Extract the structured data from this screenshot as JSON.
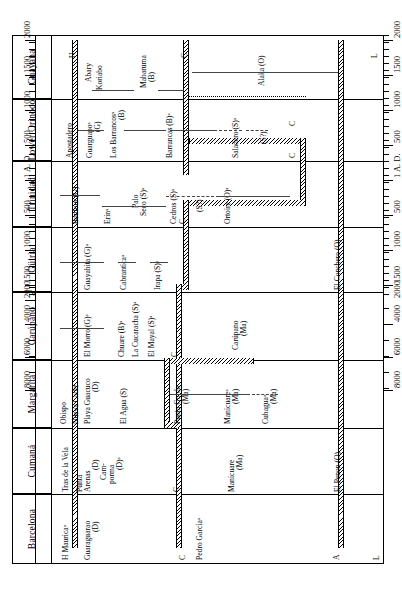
{
  "chart_data": {
    "type": "table",
    "orientation": "rotated-90",
    "xlabel": "",
    "ylabel": "",
    "axis": {
      "tick_labels": [
        "2000",
        "1500",
        "1000",
        "500",
        "1 A. D.",
        "500",
        "1000",
        "1500",
        "2000",
        "4000",
        "6000",
        "8000"
      ],
      "tick_values": [
        -2000,
        -1500,
        -1000,
        -500,
        0,
        500,
        1000,
        1500,
        2000,
        4000,
        6000,
        8000
      ],
      "note_ad_label": "1 A. D.",
      "has_scale_break_between": [
        "2000",
        "4000"
      ]
    },
    "region_columns": [
      {
        "name": "Guayana"
      },
      {
        "name": "Lower Orinoco"
      },
      {
        "name": "Trinidad"
      },
      {
        "name": "Güiria"
      },
      {
        "name": "Carúpano"
      },
      {
        "name": "Margarita"
      },
      {
        "name": "Cumaná"
      },
      {
        "name": "Barcelona"
      }
    ],
    "period_markers": [
      {
        "letter": "H",
        "meaning_position": "historic band ~1500 A.D."
      },
      {
        "letter": "C",
        "meaning_position": "ceramic boundary band ~ 1 A.D."
      },
      {
        "letter": "A",
        "meaning_position": "archaic band ~5000 B.C."
      },
      {
        "letter": "L",
        "meaning_position": "lithic band, bottom axis"
      }
    ],
    "series_codes": {
      "B": "Barrancoid",
      "D": "Dutch/Spanish historic",
      "G": "Guayabitoid",
      "Ma": "Manicuaroid",
      "O": "Ortoiroid",
      "S": "Saladoid",
      "S?": "Saladoid (uncertain)"
    },
    "sites": [
      {
        "region": "Guayana",
        "label": "H",
        "kind": "marker",
        "x_from": -1650,
        "x_to": -1650
      },
      {
        "region": "Guayana",
        "label": "Abary",
        "kind": "label-only",
        "x_from": -1250,
        "x_to": -1250
      },
      {
        "region": "Guayana",
        "label": "Koriabo",
        "kind": "bar",
        "x_from": -1200,
        "x_to": -400
      },
      {
        "region": "Guayana",
        "label": "Mabaruma\n(B)",
        "kind": "bar",
        "x_from": -450,
        "x_to": -50
      },
      {
        "region": "Guayana",
        "label": "Alaka (O)",
        "kind": "bar",
        "x_from": 400,
        "x_to": 5200
      },
      {
        "region": "Lower Orinoco",
        "label": "Apostadero",
        "kind": "label-only",
        "x_from": -1750,
        "x_to": -1750
      },
      {
        "region": "Lower Orinoco",
        "label": "Guarguapoᵃ\n(G)",
        "kind": "bar",
        "x_from": -1350,
        "x_to": -950
      },
      {
        "region": "Lower Orinoco",
        "label": "Los Barrancosᵃ\n(B)",
        "kind": "bar",
        "x_from": -950,
        "x_to": -150
      },
      {
        "region": "Lower Orinoco",
        "label": "Barrancas (B)ᵃ",
        "kind": "bar",
        "x_from": -100,
        "x_to": 1000
      },
      {
        "region": "Lower Orinoco",
        "label": "Saladero (S)ᵃ",
        "kind": "bar",
        "x_from": 700,
        "x_to": 1150
      },
      {
        "region": "Lower Orinoco",
        "label": "(S?)",
        "kind": "dash",
        "x_from": 1000,
        "x_to": 1300
      },
      {
        "region": "Lower Orinoco",
        "label": "C",
        "kind": "marker",
        "x_from": 1300,
        "x_to": 1300
      },
      {
        "region": "Trinidad",
        "label": "Bontour (G)",
        "kind": "bar",
        "x_from": -1500,
        "x_to": -1050
      },
      {
        "region": "Trinidad",
        "label": "Erinᵃ",
        "kind": "bar",
        "x_from": -1000,
        "x_to": -520
      },
      {
        "region": "Trinidad",
        "label": "Palo\nSeco (S)ᵃ",
        "kind": "bar",
        "x_from": -520,
        "x_to": -120
      },
      {
        "region": "Trinidad",
        "label": "Cedros (S)ᵃ",
        "kind": "bar",
        "x_from": -100,
        "x_to": 260
      },
      {
        "region": "Trinidad",
        "label": "(S?)",
        "kind": "dash",
        "x_from": 260,
        "x_to": 600
      },
      {
        "region": "Trinidad",
        "label": "Ortoire (O)ᵃ",
        "kind": "bar",
        "x_from": 700,
        "x_to": 1850
      },
      {
        "region": "Güiria",
        "label": "Guayabita (G)ᵃ",
        "kind": "bar",
        "x_from": -1520,
        "x_to": -1050
      },
      {
        "region": "Güiria",
        "label": "Cabranticaᵃ",
        "kind": "bar",
        "x_from": -950,
        "x_to": -700
      },
      {
        "region": "Güiria",
        "label": "Irapa (S)ᵃ",
        "kind": "bar",
        "x_from": -600,
        "x_to": -320
      },
      {
        "region": "Güiria",
        "label": "El Conchero (O)",
        "kind": "label-only",
        "x_from": 4300,
        "x_to": 4300
      },
      {
        "region": "Carúpano",
        "label": "El Morro (G)ᵃ",
        "kind": "bar",
        "x_from": -1520,
        "x_to": -1050
      },
      {
        "region": "Carúpano",
        "label": "Chuare (B)ᵃ",
        "kind": "bar",
        "x_from": -950,
        "x_to": -750
      },
      {
        "region": "Carúpano",
        "label": "La Cucaracha (S)ᵃ",
        "kind": "bar",
        "x_from": -780,
        "x_to": -560
      },
      {
        "region": "Carúpano",
        "label": "El Mayal (S)ᵃ",
        "kind": "bar",
        "x_from": -560,
        "x_to": -300
      },
      {
        "region": "Carúpano",
        "label": "Carúpano\n(Ma)",
        "kind": "bar",
        "x_from": 300,
        "x_to": 1100
      },
      {
        "region": "Margarita",
        "label": "Obispo",
        "kind": "label-only",
        "x_from": -1720,
        "x_to": -1720
      },
      {
        "region": "Margarita",
        "label": "Nueva Cadiz",
        "kind": "label-only",
        "x_from": -1570,
        "x_to": -1570
      },
      {
        "region": "Margarita",
        "label": "Playa Guacuco\n(D)",
        "kind": "bar",
        "x_from": -1450,
        "x_to": -1100
      },
      {
        "region": "Margarita",
        "label": "El Agua (S)",
        "kind": "bar",
        "x_from": -980,
        "x_to": -650
      },
      {
        "region": "Margarita",
        "label": "Punta Gorda\n(Ma)",
        "kind": "bar",
        "x_from": -50,
        "x_to": 420
      },
      {
        "region": "Margarita",
        "label": "Manicuareᵃ\n(Ma)",
        "kind": "bar",
        "x_from": 420,
        "x_to": 1150
      },
      {
        "region": "Margarita",
        "label": "Cubaguaᵃ\n(Ma)",
        "kind": "dash",
        "x_from": 1150,
        "x_to": 1480
      },
      {
        "region": "Cumaná",
        "label": "Tras de la Vela",
        "kind": "label-only",
        "x_from": -1700,
        "x_to": -1700
      },
      {
        "region": "Cumaná",
        "label": "Punta\nArenas\n(D)",
        "kind": "label-only",
        "x_from": -1470,
        "x_to": -1470
      },
      {
        "region": "Cumaná",
        "label": "Cam-\nporma\n(D)ᵃ",
        "kind": "label-only",
        "x_from": -1340,
        "x_to": -1340
      },
      {
        "region": "Cumaná",
        "label": "Manicuare\n(Ma)",
        "kind": "label-only",
        "x_from": 560,
        "x_to": 560
      },
      {
        "region": "Cumaná",
        "label": "El Penon (O)",
        "kind": "label-only",
        "x_from": 4300,
        "x_to": 4300
      },
      {
        "region": "Barcelona",
        "label": "H  Mauricaᵃ",
        "kind": "label-only",
        "x_from": -1650,
        "x_to": -1650
      },
      {
        "region": "Barcelona",
        "label": "Guaraguarao\n(D)",
        "kind": "label-only",
        "x_from": -1300,
        "x_to": -1300
      },
      {
        "region": "Barcelona",
        "label": "Pedro Garcíaᵃ",
        "kind": "label-only",
        "x_from": 300,
        "x_to": 300
      }
    ]
  },
  "figure": {
    "region_labels": [
      "Guayana",
      "Lower Orinoco",
      "Trinidad",
      "Güiria",
      "Carúpano",
      "Margarita",
      "Cumaná",
      "Barcelona"
    ],
    "axis_labels_top": [
      "2000",
      "1500",
      "1000",
      "500",
      "1 A. D.",
      "500",
      "1000",
      "1500",
      "2000",
      "4000",
      "6000",
      "8000"
    ],
    "axis_labels_bottom": [
      "2000",
      "1500",
      "1000",
      "500",
      "1 A. D.",
      "500",
      "1000",
      "1500",
      "2000",
      "4000",
      "6000",
      "8000"
    ],
    "band_letters": {
      "historic": "H",
      "ceramic": "C",
      "archaic": "A",
      "lithic": "L"
    },
    "site_texts": {
      "guayana_h": "H",
      "abary": "Abary",
      "koriabo": "Koriabo",
      "mabaruma_l1": "Mabaruma",
      "mabaruma_l2": "(B)",
      "alaka": "Alaka (O)",
      "apostadero": "Apostadero",
      "guarguapo_l1": "Guarguapoᵃ",
      "guarguapo_l2": "(G)",
      "losbarrancos_l1": "Los Barrancosᵃ",
      "losbarrancos_l2": "(B)",
      "barrancas": "Barrancas (B)ᵃ",
      "saladero": "Saladero (S)ᵃ",
      "saladero_q": "(S?)",
      "bontour": "Bontour (G)",
      "erin": "Erinᵃ",
      "paloseco_l1": "Palo",
      "paloseco_l2": "Seco (S)ᵃ",
      "cedros": "Cedros (S)ᵃ",
      "cedros_q": "(S?)",
      "ortoire": "Ortoire (O)ᵃ",
      "guayabita": "Guayabita (G)ᵃ",
      "cabrantica": "Cabranticaᵃ",
      "irapa": "Irapa (S)ᵃ",
      "elconchero": "El Conchero (O)",
      "elmorro": "El Morro (G)ᵃ",
      "chuare": "Chuare (B)ᵃ",
      "lacucaracha": "La Cucaracha (S)ᵃ",
      "elmayal": "El Mayal (S)ᵃ",
      "carupano_l1": "Carúpano",
      "carupano_l2": "(Ma)",
      "obispo": "Obispo",
      "nuevacadiz": "Nueva Cadiz",
      "playaguacuco_l1": "Playa Guacuco",
      "playaguacuco_l2": "(D)",
      "elagua": "El Agua (S)",
      "puntagorda_l1": "Punta Gorda",
      "puntagorda_l2": "(Ma)",
      "manicuare_m_l1": "Manicuareᵃ",
      "manicuare_m_l2": "(Ma)",
      "cubagua_l1": "Cubaguaᵃ",
      "cubagua_l2": "(Ma)",
      "trasdelavela": "Tras de la Vela",
      "puntaarenas_l1": "Punta",
      "puntaarenas_l2": "Arenas",
      "puntaarenas_l3": "(D)",
      "camporma_l1": "Cam-",
      "camporma_l2": "porma",
      "camporma_l3": "(D)ᵃ",
      "manicuare_c_l1": "Manicuare",
      "manicuare_c_l2": "(Ma)",
      "elpenon": "El Penon (O)",
      "hmaurica": "H  Mauricaᵃ",
      "guaraguarao_l1": "Guaraguarao",
      "guaraguarao_l2": "(D)",
      "pedrogarcia": "Pedro Garcíaᵃ",
      "c_mark": "C",
      "a_mark": "A",
      "l_mark": "L"
    }
  }
}
